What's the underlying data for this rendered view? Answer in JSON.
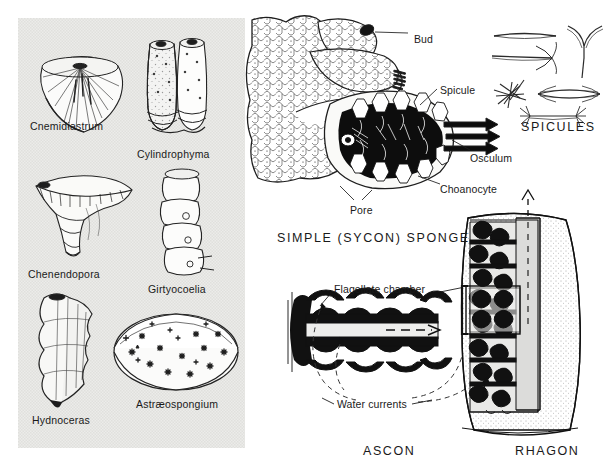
{
  "figure": {
    "ink_color": "#141414",
    "panel_tint": "#e8e8e6"
  },
  "fossil_panel": {
    "name": "fossil-sponge-genera-panel",
    "background": "#e8e8e6",
    "specimens": [
      {
        "label": "Cnemidiastrum",
        "shape": "conical-ribbed-cup",
        "x": 30,
        "y": 120
      },
      {
        "label": "Cylindrophyma",
        "shape": "paired-cylinders",
        "x": 137,
        "y": 148
      },
      {
        "label": "Chenendopora",
        "shape": "funnel-cup",
        "x": 28,
        "y": 268
      },
      {
        "label": "Girtyocoelia",
        "shape": "stacked-beads",
        "x": 148,
        "y": 283
      },
      {
        "label": "Hydnoceras",
        "shape": "nodose-vase",
        "x": 32,
        "y": 414
      },
      {
        "label": "Astræospongium",
        "shape": "discoid-bowl",
        "x": 136,
        "y": 398
      }
    ]
  },
  "sycon_panel": {
    "name": "simple-sycon-sponge-panel",
    "caption": "SIMPLE  (SYCON) SPONGE",
    "caption_pos": {
      "x": 277,
      "y": 231
    },
    "callouts": [
      {
        "label": "Bud",
        "x": 414,
        "y": 33
      },
      {
        "label": "Spicule",
        "x": 440,
        "y": 84
      },
      {
        "label": "Osculum",
        "x": 470,
        "y": 152
      },
      {
        "label": "Choanocyte",
        "x": 440,
        "y": 183
      },
      {
        "label": "Pore",
        "x": 350,
        "y": 204
      }
    ],
    "osculum_arrow_count": 3
  },
  "spicules_panel": {
    "name": "spicules-panel",
    "caption": "SPICULES",
    "caption_pos": {
      "x": 521,
      "y": 120
    },
    "types": [
      "simple-rod-oxea",
      "hooked-anchor-monaxon",
      "triaxon-y-spicule",
      "star-aster-spicule",
      "spindle-bundle-lens",
      "tipped-bar-spicule"
    ]
  },
  "canal_panel": {
    "ascon": {
      "name": "ascon-canal-diagram",
      "caption": "ASCON",
      "caption_pos": {
        "x": 363,
        "y": 444
      }
    },
    "rhagon": {
      "name": "rhagon-canal-diagram",
      "caption": "RHAGON",
      "caption_pos": {
        "x": 515,
        "y": 444
      }
    },
    "callouts": [
      {
        "label": "Flagellate chamber",
        "x": 334,
        "y": 283
      },
      {
        "label": "Water currents",
        "x": 337,
        "y": 398
      }
    ]
  }
}
